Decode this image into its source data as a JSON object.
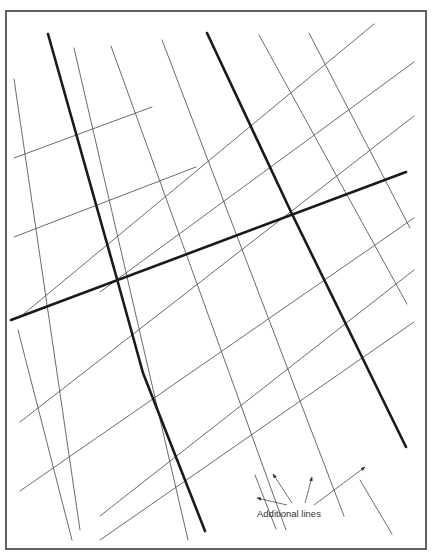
{
  "frame": {
    "x": 6,
    "y": 11,
    "w": 420,
    "h": 538
  },
  "colors": {
    "thin": "#5a5a5a",
    "thick": "#1a1a1a",
    "frame": "#3a3a3a",
    "background": "#ffffff"
  },
  "thin_lines_rising": [
    [
      14,
      158,
      152,
      107
    ],
    [
      14,
      237,
      196,
      167
    ],
    [
      20,
      317,
      374,
      24
    ],
    [
      100,
      292,
      414,
      62
    ],
    [
      20,
      422,
      414,
      116
    ],
    [
      20,
      491,
      414,
      218
    ],
    [
      100,
      516,
      414,
      270
    ],
    [
      100,
      540,
      414,
      322
    ]
  ],
  "thin_lines_falling": [
    [
      14,
      79,
      80,
      530
    ],
    [
      74,
      48,
      188,
      540
    ],
    [
      111,
      46,
      286,
      530
    ],
    [
      162,
      40,
      344,
      516
    ],
    [
      259,
      35,
      407,
      304
    ],
    [
      309,
      33,
      410,
      228
    ],
    [
      18,
      330,
      72,
      540
    ],
    [
      255,
      475,
      276,
      529
    ],
    [
      360,
      480,
      392,
      534
    ]
  ],
  "thick_lines": [
    {
      "name": "thick-line-left",
      "points": "48,34 117,279 143,373 205,531"
    },
    {
      "name": "thick-line-right",
      "points": "207,33 292,214 406,447"
    },
    {
      "name": "thick-line-horizontal",
      "points": "11,320 406,172"
    }
  ],
  "annotation": {
    "label": "Additional lines",
    "label_x": 257,
    "label_y": 517,
    "arrows": [
      [
        287,
        505,
        257,
        498
      ],
      [
        292,
        503,
        273,
        474
      ],
      [
        305,
        503,
        312,
        477
      ],
      [
        314,
        505,
        365,
        467
      ]
    ]
  }
}
